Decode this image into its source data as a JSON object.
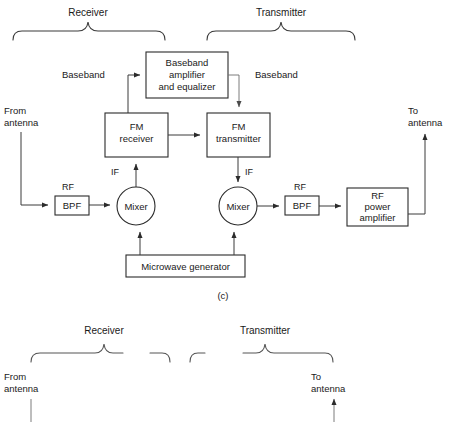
{
  "figure": {
    "caption": "(c)",
    "groups": {
      "receiver": "Receiver",
      "transmitter": "Transmitter"
    }
  },
  "blocks": {
    "baseband_amp": {
      "line1": "Baseband",
      "line2": "amplifier",
      "line3": "and equalizer"
    },
    "fm_receiver": {
      "line1": "FM",
      "line2": "receiver"
    },
    "fm_transmitter": {
      "line1": "FM",
      "line2": "transmitter"
    },
    "bpf_left": "BPF",
    "bpf_right": "BPF",
    "mixer_left": "Mixer",
    "mixer_right": "Mixer",
    "rf_power_amp": {
      "line1": "RF",
      "line2": "power",
      "line3": "amplifier"
    },
    "microwave_generator": "Microwave generator"
  },
  "signal_labels": {
    "baseband_in": "Baseband",
    "baseband_out": "Baseband",
    "if_left": "IF",
    "if_right": "IF",
    "rf_left": "RF",
    "rf_right": "RF"
  },
  "ports": {
    "from_antenna_line1": "From",
    "from_antenna_line2": "antenna",
    "to_antenna_line1": "To",
    "to_antenna_line2": "antenna"
  },
  "next_figure": {
    "groups": {
      "receiver": "Receiver",
      "transmitter": "Transmitter"
    },
    "ports": {
      "from_antenna_line1": "From",
      "from_antenna_line2": "antenna",
      "to_antenna_line1": "To",
      "to_antenna_line2": "antenna"
    }
  },
  "colors": {
    "stroke": "#2b2b2b",
    "wire": "#3a3a3a",
    "background": "#ffffff",
    "text": "#1a1a1a"
  }
}
